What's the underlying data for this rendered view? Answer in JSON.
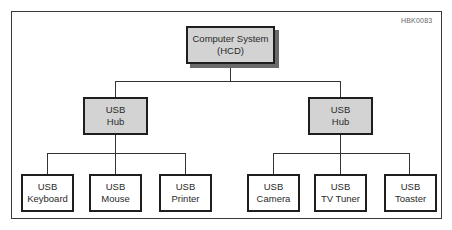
{
  "diagram": {
    "code": "HBK0083",
    "root": {
      "line1": "Computer System",
      "line2": "(HCD)"
    },
    "hubs": [
      {
        "line1": "USB",
        "line2": "Hub"
      },
      {
        "line1": "USB",
        "line2": "Hub"
      }
    ],
    "devices": [
      {
        "line1": "USB",
        "line2": "Keyboard"
      },
      {
        "line1": "USB",
        "line2": "Mouse"
      },
      {
        "line1": "USB",
        "line2": "Printer"
      },
      {
        "line1": "USB",
        "line2": "Camera"
      },
      {
        "line1": "USB",
        "line2": "TV Tuner"
      },
      {
        "line1": "USB",
        "line2": "Toaster"
      }
    ],
    "colors": {
      "node_fill_gray": "#d3d3d3",
      "node_fill_white": "#ffffff",
      "border": "#1e1e1e",
      "shadow": "#6a6a6a"
    }
  }
}
